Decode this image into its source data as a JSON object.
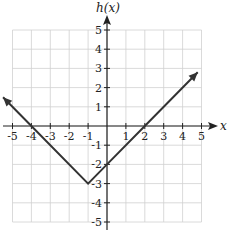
{
  "chart_data": {
    "type": "line",
    "title": "",
    "xlabel": "x",
    "ylabel": "h(x)",
    "xlim": [
      -5,
      5
    ],
    "ylim": [
      -5,
      5
    ],
    "grid": true,
    "x_ticks": [
      -5,
      -4,
      -3,
      -2,
      -1,
      1,
      2,
      3,
      4,
      5
    ],
    "y_ticks": [
      5,
      4,
      3,
      2,
      1,
      -1,
      -2,
      -3,
      -4,
      -5
    ],
    "series": [
      {
        "name": "h(x) = |x + 1| - 3",
        "points": [
          [
            -5.5,
            1.5
          ],
          [
            -4,
            0
          ],
          [
            -1,
            -3
          ],
          [
            0,
            -2
          ],
          [
            2,
            0
          ],
          [
            4.8,
            2.8
          ]
        ],
        "arrows": "both"
      }
    ],
    "key_points": {
      "vertex": [
        -1,
        -3
      ],
      "x_intercepts": [
        -4,
        2
      ],
      "y_intercept": -2
    }
  },
  "labels": {
    "x_axis": "x",
    "y_axis": "h(x)"
  },
  "colors": {
    "line": "#333333",
    "grid": "#d0d0d0",
    "axis": "#222222"
  }
}
